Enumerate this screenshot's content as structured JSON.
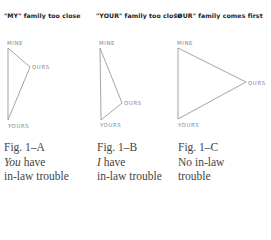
{
  "figures": [
    {
      "id": "A",
      "title": "\"MY\" family too close",
      "vertices": {
        "mine": "MINE",
        "ours": "OURS",
        "yours": "YOURS"
      },
      "caption": {
        "fig": "Fig. 1–A",
        "line1_em": "You",
        "line1_rest": " have",
        "line2": "in-law trouble"
      }
    },
    {
      "id": "B",
      "title": "\"YOUR\" family too close",
      "vertices": {
        "mine": "MINE",
        "ours": "OURS",
        "yours": "YOURS"
      },
      "caption": {
        "fig": "Fig. 1–B",
        "line1_em": "I",
        "line1_rest": " have",
        "line2": "in-law trouble"
      }
    },
    {
      "id": "C",
      "title": "\"OUR\" family comes first",
      "vertices": {
        "mine": "MINE",
        "ours": "OURS",
        "yours": "YOURS"
      },
      "caption": {
        "fig": "Fig. 1–C",
        "line1": "No in-law",
        "line2": "trouble"
      }
    }
  ],
  "colors": {
    "line": "#9a9a9a",
    "title": "#1a1a1a",
    "label": "#888888",
    "caption": "#444444"
  }
}
